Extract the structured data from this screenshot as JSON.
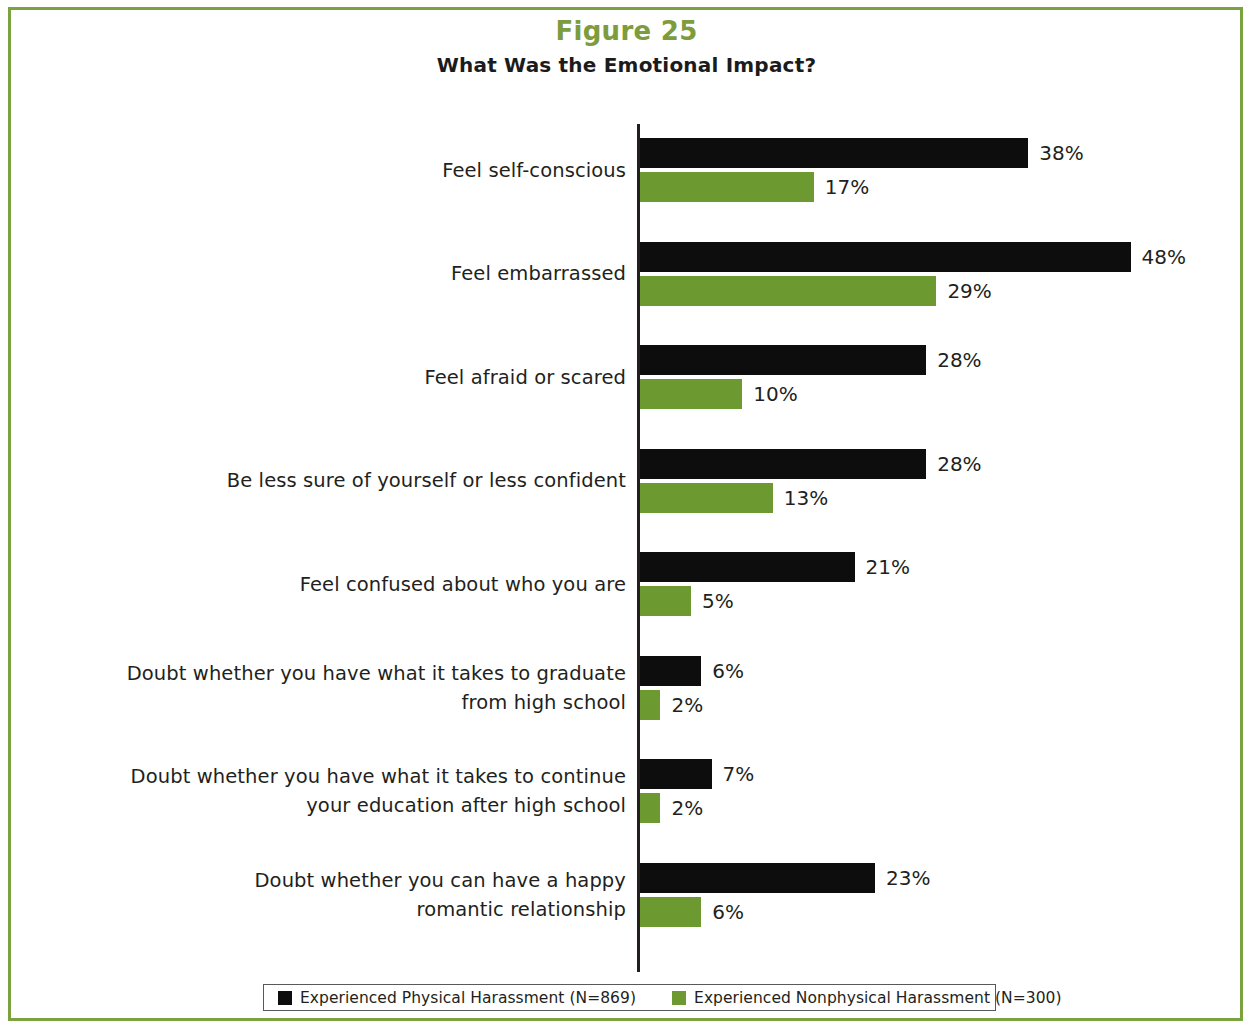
{
  "figure": {
    "title": "Figure 25",
    "subtitle": "What Was the Emotional Impact?",
    "title_color": "#7d9c3e"
  },
  "legend": {
    "series": [
      {
        "label": "Experienced Physical Harassment (N=869)",
        "color": "#0d0d0d",
        "swatch": "black-square-icon"
      },
      {
        "label": "Experienced Nonphysical Harassment (N=300)",
        "color": "#6d9a30",
        "swatch": "green-square-icon"
      }
    ]
  },
  "chart_data": {
    "type": "bar",
    "orientation": "horizontal",
    "title": "Figure 25",
    "subtitle": "What Was the Emotional Impact?",
    "xlabel": "",
    "ylabel": "",
    "xlim": [
      0,
      50
    ],
    "grid": false,
    "legend_position": "bottom",
    "value_suffix": "%",
    "categories": [
      "Feel self-conscious",
      "Feel embarrassed",
      "Feel afraid or scared",
      "Be less sure of yourself or less confident",
      "Feel confused about who you are",
      "Doubt whether you have what it takes to graduate from high school",
      "Doubt whether you have what it takes to continue your education after high school",
      "Doubt whether you can have a happy romantic relationship"
    ],
    "category_lines": [
      [
        "Feel self-conscious"
      ],
      [
        "Feel embarrassed"
      ],
      [
        "Feel afraid or scared"
      ],
      [
        "Be less sure of yourself or less confident"
      ],
      [
        "Feel confused about who you are"
      ],
      [
        "Doubt whether you have what it takes to graduate",
        "from high school"
      ],
      [
        "Doubt whether you have what it takes to continue",
        "your education after high school"
      ],
      [
        "Doubt whether you can have a happy",
        "romantic relationship"
      ]
    ],
    "series": [
      {
        "name": "Experienced Physical Harassment (N=869)",
        "color": "#0d0d0d",
        "values": [
          38,
          48,
          28,
          28,
          21,
          6,
          7,
          23
        ],
        "labels": [
          "38%",
          "48%",
          "28%",
          "28%",
          "21%",
          "6%",
          "7%",
          "23%"
        ]
      },
      {
        "name": "Experienced Nonphysical Harassment (N=300)",
        "color": "#6d9a30",
        "values": [
          17,
          29,
          10,
          13,
          5,
          2,
          2,
          6
        ],
        "labels": [
          "17%",
          "29%",
          "10%",
          "13%",
          "5%",
          "2%",
          "2%",
          "6%"
        ]
      }
    ]
  }
}
